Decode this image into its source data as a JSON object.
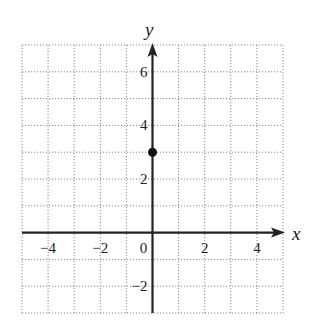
{
  "chart_data": {
    "type": "scatter",
    "title": "",
    "xlabel": "x",
    "ylabel": "y",
    "xlim": [
      -5,
      5
    ],
    "ylim": [
      -3,
      7
    ],
    "grid": true,
    "grid_style": "dotted",
    "x_ticks": [
      -4,
      -2,
      0,
      2,
      4
    ],
    "y_ticks": [
      -2,
      2,
      4,
      6
    ],
    "x_tick_labels": [
      "−4",
      "−2",
      "0",
      "2",
      "4"
    ],
    "y_tick_labels": [
      "−2",
      "2",
      "4",
      "6"
    ],
    "series": [
      {
        "name": "point",
        "points": [
          {
            "x": 0,
            "y": 3
          }
        ],
        "marker": "filled-circle",
        "color": "#111111"
      }
    ],
    "axis_arrows": {
      "x_positive": true,
      "y_positive": true
    }
  },
  "colors": {
    "axis": "#222222",
    "grid": "#8a8a8a",
    "point": "#111111"
  }
}
